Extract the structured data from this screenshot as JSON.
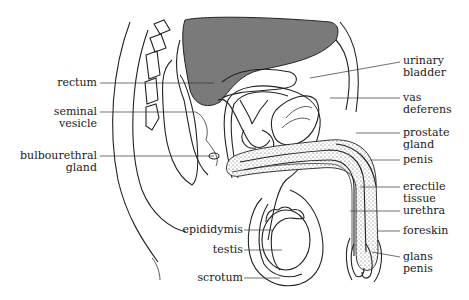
{
  "diagram": {
    "colors": {
      "line": "#222222",
      "bladder_fill": "#7a7a7a",
      "background": "#ffffff"
    },
    "labels_left": [
      {
        "id": "rectum",
        "lines": [
          "rectum"
        ]
      },
      {
        "id": "seminal-vesicle",
        "lines": [
          "seminal",
          "vesicle"
        ]
      },
      {
        "id": "bulbourethral-gland",
        "lines": [
          "bulbourethral",
          "gland"
        ]
      },
      {
        "id": "epididymis",
        "lines": [
          "epididymis"
        ]
      },
      {
        "id": "testis",
        "lines": [
          "testis"
        ]
      },
      {
        "id": "scrotum",
        "lines": [
          "scrotum"
        ]
      }
    ],
    "labels_right": [
      {
        "id": "urinary-bladder",
        "lines": [
          "urinary",
          "bladder"
        ]
      },
      {
        "id": "vas-deferens",
        "lines": [
          "vas",
          "deferens"
        ]
      },
      {
        "id": "prostate-gland",
        "lines": [
          "prostate",
          "gland"
        ]
      },
      {
        "id": "penis",
        "lines": [
          "penis"
        ]
      },
      {
        "id": "erectile-tissue",
        "lines": [
          "erectile",
          "tissue"
        ]
      },
      {
        "id": "urethra",
        "lines": [
          "urethra"
        ]
      },
      {
        "id": "foreskin",
        "lines": [
          "foreskin"
        ]
      },
      {
        "id": "glans-penis",
        "lines": [
          "glans",
          "penis"
        ]
      }
    ]
  }
}
